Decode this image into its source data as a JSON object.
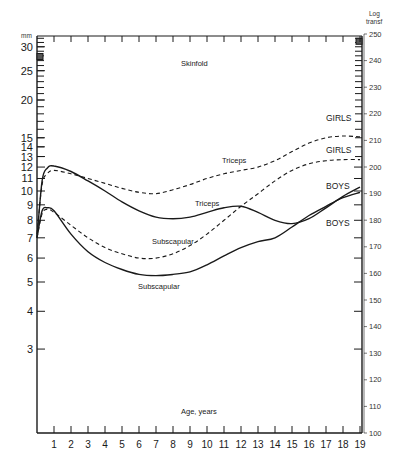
{
  "chart_data": {
    "type": "line",
    "title": "Skinfold",
    "xlabel": "Age, years",
    "ylabel_left": "mm",
    "ylabel_right": "Log transf",
    "x_ticks": [
      1,
      2,
      3,
      4,
      5,
      6,
      7,
      8,
      9,
      10,
      11,
      12,
      13,
      14,
      15,
      16,
      17,
      18,
      19
    ],
    "y_left_ticks": [
      3,
      4,
      5,
      6,
      7,
      8,
      9,
      10,
      11,
      12,
      13,
      14,
      15,
      20,
      25,
      30
    ],
    "y_right_ticks": [
      100,
      110,
      120,
      130,
      140,
      150,
      160,
      170,
      180,
      190,
      200,
      210,
      220,
      230,
      240,
      250
    ],
    "y_left_scale": "log",
    "xlim": [
      0,
      19
    ],
    "ylim_left_mm": [
      2.7,
      33
    ],
    "ylim_right": [
      100,
      250
    ],
    "grid": false,
    "series": [
      {
        "name": "Triceps GIRLS",
        "style": "dashed",
        "x": [
          0,
          0.3,
          0.6,
          1,
          2,
          3,
          4,
          5,
          6,
          7,
          8,
          9,
          10,
          11,
          12,
          13,
          14,
          15,
          16,
          17,
          18,
          19
        ],
        "y_mm": [
          7.2,
          10.5,
          11.4,
          11.7,
          11.4,
          11.0,
          10.6,
          10.2,
          9.9,
          9.8,
          10.1,
          10.5,
          11.0,
          11.4,
          11.7,
          12.0,
          12.6,
          13.5,
          14.4,
          15.0,
          15.2,
          15.1
        ]
      },
      {
        "name": "Triceps BOYS",
        "style": "solid",
        "x": [
          0,
          0.3,
          0.6,
          1,
          2,
          3,
          4,
          5,
          6,
          7,
          8,
          9,
          10,
          11,
          12,
          13,
          14,
          15,
          16,
          17,
          18,
          19
        ],
        "y_mm": [
          7.0,
          10.8,
          11.9,
          12.1,
          11.6,
          10.8,
          10.0,
          9.2,
          8.6,
          8.2,
          8.1,
          8.2,
          8.5,
          8.8,
          8.9,
          8.5,
          8.0,
          7.8,
          8.1,
          8.8,
          9.6,
          10.3
        ]
      },
      {
        "name": "Subscapular GIRLS",
        "style": "dashed",
        "x": [
          0,
          0.3,
          0.6,
          1,
          2,
          3,
          4,
          5,
          6,
          7,
          8,
          9,
          10,
          11,
          12,
          13,
          14,
          15,
          16,
          17,
          18,
          19
        ],
        "y_mm": [
          7.0,
          8.4,
          8.7,
          8.5,
          7.7,
          7.0,
          6.5,
          6.2,
          6.0,
          6.0,
          6.2,
          6.6,
          7.2,
          8.0,
          8.9,
          9.8,
          10.8,
          11.7,
          12.3,
          12.6,
          12.7,
          12.7
        ]
      },
      {
        "name": "Subscapular BOYS",
        "style": "solid",
        "x": [
          0,
          0.3,
          0.6,
          1,
          2,
          3,
          4,
          5,
          6,
          7,
          8,
          9,
          10,
          11,
          12,
          13,
          14,
          15,
          16,
          17,
          18,
          19
        ],
        "y_mm": [
          7.0,
          8.6,
          8.8,
          8.6,
          7.2,
          6.3,
          5.8,
          5.5,
          5.3,
          5.25,
          5.3,
          5.4,
          5.7,
          6.1,
          6.5,
          6.8,
          7.0,
          7.6,
          8.3,
          8.9,
          9.5,
          9.9
        ]
      }
    ],
    "annotations": [
      "Skinfold",
      "Triceps",
      "Triceps",
      "Subscapular",
      "Subscapular",
      "GIRLS",
      "GIRLS",
      "BOYS",
      "BOYS",
      "Age, years"
    ]
  },
  "labels": {
    "title": "Skinfold",
    "x_axis": "Age, years",
    "left_unit": "mm",
    "right_unit_line1": "Log",
    "right_unit_line2": "transf",
    "triceps_girls": "Triceps",
    "triceps_boys": "Triceps",
    "subscap_girls": "Subscapular",
    "subscap_boys": "Subscapular",
    "girls_1": "GIRLS",
    "girls_2": "GIRLS",
    "boys_1": "BOYS",
    "boys_2": "BOYS"
  },
  "style": {
    "ink": "#1a1a1a",
    "background": "#ffffff"
  }
}
